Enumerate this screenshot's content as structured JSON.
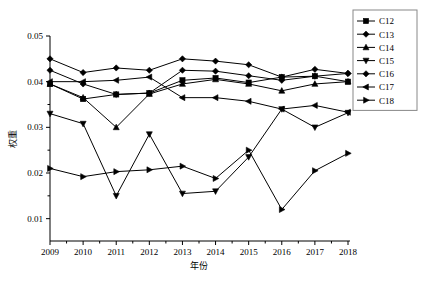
{
  "chart_data": {
    "type": "line",
    "title": "",
    "xlabel": "年份",
    "ylabel": "权重",
    "x": [
      2009,
      2010,
      2011,
      2012,
      2013,
      2014,
      2015,
      2016,
      2017,
      2018
    ],
    "xticklabels": [
      "2009",
      "2010",
      "2011",
      "2012",
      "2013",
      "2014",
      "2015",
      "2016",
      "2017",
      "2018"
    ],
    "yticklabels": [
      "0.01",
      "0.02",
      "0.03",
      "0.04",
      "0.05"
    ],
    "yticks": [
      0.01,
      0.02,
      0.03,
      0.04,
      0.05
    ],
    "ylim": [
      0.005,
      0.05
    ],
    "xlim": [
      2009,
      2018
    ],
    "grid": false,
    "legend_position": "top-right",
    "series": [
      {
        "name": "C12",
        "marker": "square",
        "values": [
          0.0395,
          0.0362,
          0.0372,
          0.0375,
          0.0403,
          0.0408,
          0.0398,
          0.041,
          0.0412,
          0.04
        ]
      },
      {
        "name": "C13",
        "marker": "diamond-filled",
        "values": [
          0.045,
          0.042,
          0.043,
          0.0425,
          0.045,
          0.0445,
          0.0437,
          0.041,
          0.0427,
          0.0418
        ]
      },
      {
        "name": "C14",
        "marker": "triangle-up",
        "values": [
          0.0395,
          0.0365,
          0.03,
          0.0373,
          0.0395,
          0.0405,
          0.0395,
          0.038,
          0.0395,
          0.04
        ]
      },
      {
        "name": "C15",
        "marker": "triangle-down",
        "values": [
          0.033,
          0.0308,
          0.015,
          0.0285,
          0.0155,
          0.016,
          0.0235,
          0.034,
          0.03,
          0.0332
        ]
      },
      {
        "name": "C16",
        "marker": "diamond",
        "values": [
          0.0425,
          0.0395,
          0.0372,
          0.0375,
          0.0425,
          0.0423,
          0.0413,
          0.0403,
          0.0412,
          0.0418
        ]
      },
      {
        "name": "C17",
        "marker": "triangle-left",
        "values": [
          0.04,
          0.04,
          0.0403,
          0.041,
          0.0365,
          0.0365,
          0.0357,
          0.034,
          0.0348,
          0.0333
        ]
      },
      {
        "name": "C18",
        "marker": "triangle-right",
        "values": [
          0.021,
          0.0192,
          0.0203,
          0.0207,
          0.0215,
          0.0188,
          0.025,
          0.012,
          0.0205,
          0.0243
        ]
      }
    ],
    "legend": [
      "C12",
      "C13",
      "C14",
      "C15",
      "C16",
      "C17",
      "C18"
    ]
  },
  "colors": {
    "ink": "#000000",
    "legend_border": "#888888",
    "background": "#ffffff"
  }
}
